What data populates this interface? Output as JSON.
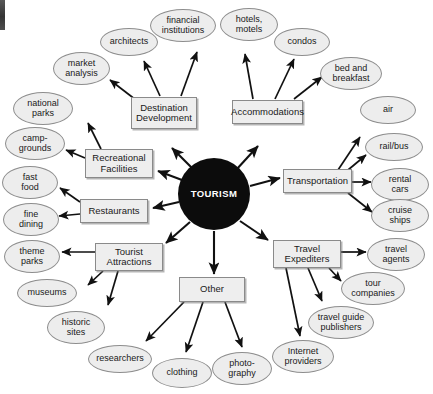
{
  "diagram": {
    "title": "TOURISM",
    "type": "radial concept map",
    "colors": {
      "hub_fill": "#0c0c0c",
      "hub_text": "#ffffff",
      "node_fill": "#ededed",
      "box_fill": "#eeeeee",
      "stroke": "#8a8a8a",
      "arrow": "#111111",
      "background": "#ffffff"
    },
    "hub": {
      "label": "TOURISM",
      "cx": 214,
      "cy": 194,
      "r": 36
    },
    "categories": [
      {
        "id": "destination-development",
        "label": "Destination\nDevelopment",
        "line1": "Destination",
        "line2": "Development",
        "x": 131,
        "y": 97,
        "w": 66,
        "h": 32,
        "children": [
          "market-analysis",
          "architects",
          "financial-institutions"
        ]
      },
      {
        "id": "accommodations",
        "label": "Accommodations",
        "line1": "Accommodations",
        "line2": "",
        "x": 232,
        "y": 100,
        "w": 71,
        "h": 24,
        "children": [
          "hotels-motels",
          "condos",
          "bed-and-breakfast"
        ]
      },
      {
        "id": "recreational-facilities",
        "label": "Recreational\nFacilities",
        "line1": "Recreational",
        "line2": "Facilities",
        "x": 85,
        "y": 149,
        "w": 68,
        "h": 29,
        "children": [
          "national-parks",
          "camp-grounds"
        ]
      },
      {
        "id": "transportation",
        "label": "Transportation",
        "line1": "Transportation",
        "line2": "",
        "x": 283,
        "y": 169,
        "w": 69,
        "h": 24,
        "children": [
          "air",
          "rail-bus",
          "rental-cars",
          "cruise-ships"
        ]
      },
      {
        "id": "restaurants",
        "label": "Restaurants",
        "line1": "Restaurants",
        "line2": "",
        "x": 80,
        "y": 199,
        "w": 68,
        "h": 24,
        "children": [
          "fast-food",
          "fine-dining"
        ]
      },
      {
        "id": "tourist-attractions",
        "label": "Tourist\nAttractions",
        "line1": "Tourist",
        "line2": "Attractions",
        "x": 95,
        "y": 243,
        "w": 68,
        "h": 28,
        "children": [
          "theme-parks",
          "museums",
          "historic-sites"
        ]
      },
      {
        "id": "travel-expediters",
        "label": "Travel\nExpediters",
        "line1": "Travel",
        "line2": "Expediters",
        "x": 273,
        "y": 240,
        "w": 68,
        "h": 28,
        "children": [
          "travel-agents",
          "tour-companies",
          "travel-guide-publishers",
          "internet-providers"
        ]
      },
      {
        "id": "other",
        "label": "Other",
        "line1": "Other",
        "line2": "",
        "x": 179,
        "y": 277,
        "w": 66,
        "h": 25,
        "children": [
          "researchers",
          "clothing",
          "photography"
        ]
      }
    ],
    "leaves": [
      {
        "id": "financial-institutions",
        "line1": "financial",
        "line2": "institutions",
        "x": 150,
        "y": 9,
        "w": 66,
        "h": 33
      },
      {
        "id": "hotels-motels",
        "line1": "hotels,",
        "line2": "motels",
        "x": 220,
        "y": 8,
        "w": 58,
        "h": 33
      },
      {
        "id": "architects",
        "line1": "architects",
        "line2": "",
        "x": 100,
        "y": 28,
        "w": 58,
        "h": 28
      },
      {
        "id": "condos",
        "line1": "condos",
        "line2": "",
        "x": 274,
        "y": 28,
        "w": 56,
        "h": 28
      },
      {
        "id": "market-analysis",
        "line1": "market",
        "line2": "analysis",
        "x": 53,
        "y": 52,
        "w": 57,
        "h": 33
      },
      {
        "id": "bed-and-breakfast",
        "line1": "bed and",
        "line2": "breakfast",
        "x": 320,
        "y": 57,
        "w": 62,
        "h": 33
      },
      {
        "id": "national-parks",
        "line1": "national",
        "line2": "parks",
        "x": 13,
        "y": 92,
        "w": 60,
        "h": 33
      },
      {
        "id": "air",
        "line1": "air",
        "line2": "",
        "x": 360,
        "y": 96,
        "w": 56,
        "h": 28
      },
      {
        "id": "camp-grounds",
        "line1": "camp-",
        "line2": "grounds",
        "x": 5,
        "y": 127,
        "w": 60,
        "h": 33
      },
      {
        "id": "rail-bus",
        "line1": "rail/bus",
        "line2": "",
        "x": 365,
        "y": 133,
        "w": 58,
        "h": 28
      },
      {
        "id": "fast-food",
        "line1": "fast",
        "line2": "food",
        "x": 2,
        "y": 166,
        "w": 56,
        "h": 33
      },
      {
        "id": "rental-cars",
        "line1": "rental",
        "line2": "cars",
        "x": 371,
        "y": 168,
        "w": 58,
        "h": 33
      },
      {
        "id": "fine-dining",
        "line1": "fine",
        "line2": "dining",
        "x": 3,
        "y": 203,
        "w": 56,
        "h": 33
      },
      {
        "id": "cruise-ships",
        "line1": "cruise",
        "line2": "ships",
        "x": 371,
        "y": 199,
        "w": 58,
        "h": 33
      },
      {
        "id": "theme-parks",
        "line1": "theme",
        "line2": "parks",
        "x": 4,
        "y": 240,
        "w": 56,
        "h": 33
      },
      {
        "id": "travel-agents",
        "line1": "travel",
        "line2": "agents",
        "x": 367,
        "y": 238,
        "w": 58,
        "h": 33
      },
      {
        "id": "museums",
        "line1": "museums",
        "line2": "",
        "x": 17,
        "y": 279,
        "w": 60,
        "h": 28
      },
      {
        "id": "tour-companies",
        "line1": "tour",
        "line2": "companies",
        "x": 341,
        "y": 272,
        "w": 64,
        "h": 33
      },
      {
        "id": "historic-sites",
        "line1": "historic",
        "line2": "sites",
        "x": 47,
        "y": 311,
        "w": 58,
        "h": 33
      },
      {
        "id": "travel-guide-publishers",
        "line1": "travel guide",
        "line2": "publishers",
        "x": 308,
        "y": 306,
        "w": 66,
        "h": 33
      },
      {
        "id": "internet-providers",
        "line1": "Internet",
        "line2": "providers",
        "x": 272,
        "y": 340,
        "w": 62,
        "h": 33
      },
      {
        "id": "researchers",
        "line1": "researchers",
        "line2": "",
        "x": 88,
        "y": 345,
        "w": 64,
        "h": 28
      },
      {
        "id": "clothing",
        "line1": "clothing",
        "line2": "",
        "x": 152,
        "y": 358,
        "w": 60,
        "h": 30
      },
      {
        "id": "photography",
        "line1": "photo-",
        "line2": "graphy",
        "x": 212,
        "y": 352,
        "w": 60,
        "h": 33
      }
    ],
    "hub_arrows": [
      {
        "to": "destination-development",
        "x1": 196,
        "y1": 172,
        "x2": 172,
        "y2": 148
      },
      {
        "to": "accommodations",
        "x1": 236,
        "y1": 170,
        "x2": 258,
        "y2": 146
      },
      {
        "to": "recreational-facilities",
        "x1": 182,
        "y1": 180,
        "x2": 158,
        "y2": 171
      },
      {
        "to": "transportation",
        "x1": 250,
        "y1": 186,
        "x2": 280,
        "y2": 178
      },
      {
        "to": "restaurants",
        "x1": 179,
        "y1": 202,
        "x2": 153,
        "y2": 208
      },
      {
        "to": "tourist-attractions",
        "x1": 190,
        "y1": 222,
        "x2": 166,
        "y2": 243
      },
      {
        "to": "travel-expediters",
        "x1": 240,
        "y1": 221,
        "x2": 268,
        "y2": 240
      },
      {
        "to": "other",
        "x1": 214,
        "y1": 231,
        "x2": 214,
        "y2": 274
      }
    ],
    "child_arrows": [
      {
        "from": "destination-development",
        "to": "market-analysis",
        "x1": 136,
        "y1": 100,
        "x2": 110,
        "y2": 80
      },
      {
        "from": "destination-development",
        "to": "architects",
        "x1": 160,
        "y1": 96,
        "x2": 144,
        "y2": 61
      },
      {
        "from": "destination-development",
        "to": "financial-institutions",
        "x1": 181,
        "y1": 96,
        "x2": 197,
        "y2": 52
      },
      {
        "from": "accommodations",
        "to": "hotels-motels",
        "x1": 253,
        "y1": 99,
        "x2": 245,
        "y2": 54
      },
      {
        "from": "accommodations",
        "to": "condos",
        "x1": 275,
        "y1": 99,
        "x2": 294,
        "y2": 59
      },
      {
        "from": "accommodations",
        "to": "bed-and-breakfast",
        "x1": 294,
        "y1": 99,
        "x2": 322,
        "y2": 77
      },
      {
        "from": "recreational-facilities",
        "to": "national-parks",
        "x1": 101,
        "y1": 149,
        "x2": 88,
        "y2": 123
      },
      {
        "from": "recreational-facilities",
        "to": "camp-grounds",
        "x1": 85,
        "y1": 158,
        "x2": 66,
        "y2": 150
      },
      {
        "from": "transportation",
        "to": "air",
        "x1": 338,
        "y1": 170,
        "x2": 360,
        "y2": 137
      },
      {
        "from": "transportation",
        "to": "rail-bus",
        "x1": 348,
        "y1": 170,
        "x2": 366,
        "y2": 155
      },
      {
        "from": "transportation",
        "to": "rental-cars",
        "x1": 352,
        "y1": 182,
        "x2": 371,
        "y2": 182
      },
      {
        "from": "transportation",
        "to": "cruise-ships",
        "x1": 348,
        "y1": 193,
        "x2": 372,
        "y2": 212
      },
      {
        "from": "restaurants",
        "to": "fast-food",
        "x1": 80,
        "y1": 202,
        "x2": 60,
        "y2": 188
      },
      {
        "from": "restaurants",
        "to": "fine-dining",
        "x1": 80,
        "y1": 214,
        "x2": 59,
        "y2": 216
      },
      {
        "from": "tourist-attractions",
        "to": "theme-parks",
        "x1": 95,
        "y1": 252,
        "x2": 62,
        "y2": 252
      },
      {
        "from": "tourist-attractions",
        "to": "museums",
        "x1": 103,
        "y1": 271,
        "x2": 88,
        "y2": 285
      },
      {
        "from": "tourist-attractions",
        "to": "historic-sites",
        "x1": 118,
        "y1": 271,
        "x2": 108,
        "y2": 305
      },
      {
        "from": "travel-expediters",
        "to": "travel-agents",
        "x1": 341,
        "y1": 252,
        "x2": 366,
        "y2": 252
      },
      {
        "from": "travel-expediters",
        "to": "tour-companies",
        "x1": 329,
        "y1": 268,
        "x2": 341,
        "y2": 281
      },
      {
        "from": "travel-expediters",
        "to": "travel-guide-publishers",
        "x1": 308,
        "y1": 268,
        "x2": 322,
        "y2": 301
      },
      {
        "from": "travel-expediters",
        "to": "internet-providers",
        "x1": 286,
        "y1": 268,
        "x2": 300,
        "y2": 336
      },
      {
        "from": "other",
        "to": "researchers",
        "x1": 184,
        "y1": 302,
        "x2": 146,
        "y2": 341
      },
      {
        "from": "other",
        "to": "clothing",
        "x1": 203,
        "y1": 302,
        "x2": 186,
        "y2": 352
      },
      {
        "from": "other",
        "to": "photography",
        "x1": 225,
        "y1": 302,
        "x2": 242,
        "y2": 347
      }
    ]
  }
}
